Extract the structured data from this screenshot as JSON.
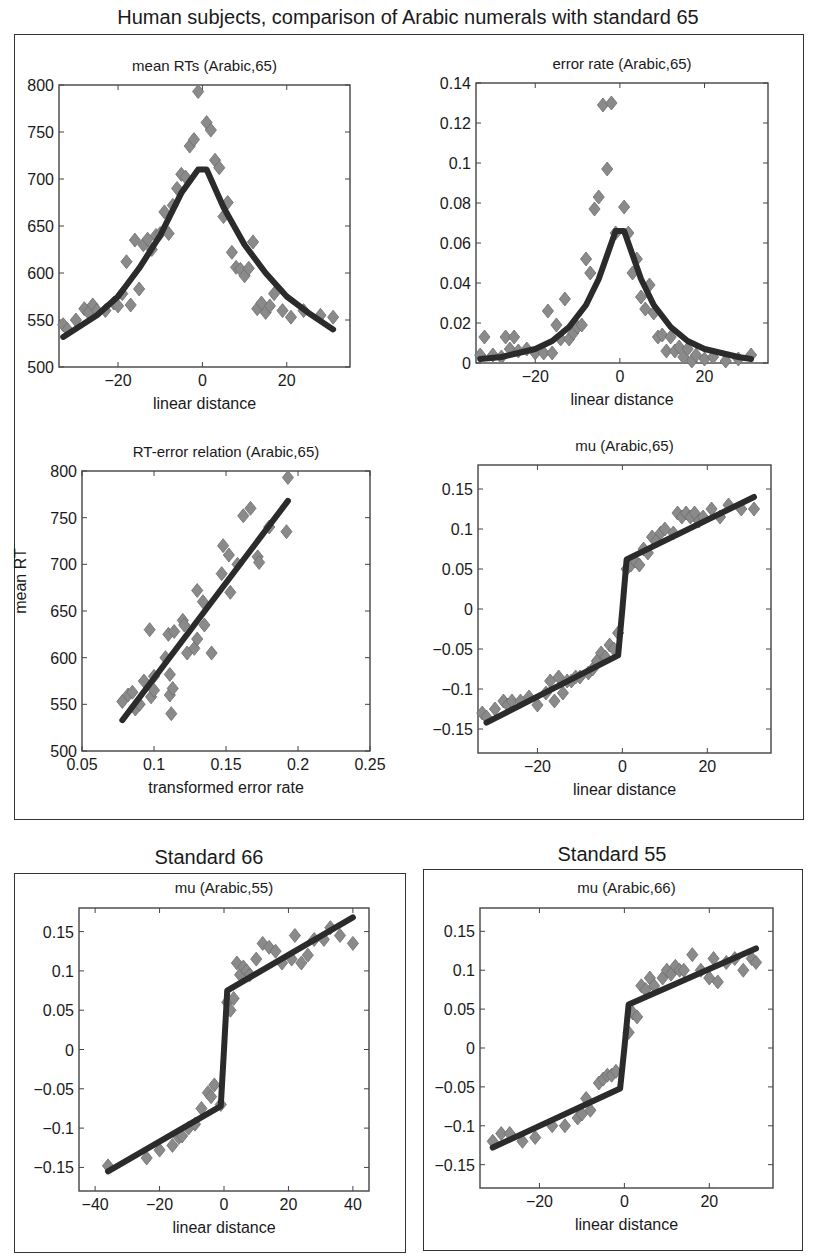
{
  "figure": {
    "title": "Human subjects, comparison of Arabic numerals with standard 65",
    "group_titles": [
      "Standard 66",
      "Standard 55"
    ],
    "colors": {
      "marker": "#8a8a8a",
      "marker_edge": "#6e6e6e",
      "fit_line": "#2b2b2b",
      "axes": "#444444"
    }
  },
  "chart_data": [
    {
      "id": "mean_rts",
      "type": "scatter",
      "title": "mean RTs (Arabic,65)",
      "xlabel": "linear distance",
      "ylabel": "",
      "xlim": [
        -34,
        35
      ],
      "ylim": [
        500,
        800
      ],
      "xticks": [
        -20,
        0,
        20
      ],
      "yticks": [
        500,
        550,
        600,
        650,
        700,
        750,
        800
      ],
      "xticklabels": [
        "−20",
        "0",
        "20"
      ],
      "yticklabels": [
        "500",
        "550",
        "600",
        "650",
        "700",
        "750",
        "800"
      ],
      "series": [
        {
          "name": "data",
          "kind": "scatter",
          "x": [
            -33,
            -32,
            -30,
            -28,
            -27,
            -26,
            -25,
            -23,
            -21,
            -20,
            -19,
            -18,
            -17,
            -16,
            -15,
            -14,
            -13,
            -12,
            -11,
            -10,
            -9,
            -8,
            -7,
            -6,
            -5,
            -4,
            -3,
            -2,
            -1,
            1,
            2,
            3,
            4,
            5,
            6,
            7,
            8,
            9,
            10,
            11,
            12,
            13,
            14,
            15,
            16,
            17,
            19,
            21,
            24,
            28,
            31
          ],
          "y": [
            545,
            540,
            550,
            562,
            558,
            566,
            560,
            560,
            568,
            565,
            578,
            612,
            566,
            635,
            583,
            630,
            636,
            625,
            640,
            642,
            665,
            642,
            672,
            690,
            705,
            702,
            735,
            742,
            793,
            760,
            752,
            720,
            712,
            660,
            675,
            622,
            606,
            604,
            597,
            605,
            633,
            562,
            568,
            558,
            565,
            578,
            560,
            553,
            560,
            555,
            553
          ]
        },
        {
          "name": "fit",
          "kind": "line",
          "x": [
            -33,
            -25,
            -20,
            -15,
            -10,
            -5,
            -1,
            1,
            5,
            10,
            15,
            20,
            25,
            31
          ],
          "y": [
            532,
            555,
            575,
            605,
            640,
            685,
            710,
            710,
            670,
            630,
            600,
            575,
            558,
            540
          ]
        }
      ]
    },
    {
      "id": "error_rate",
      "type": "scatter",
      "title": "error rate (Arabic,65)",
      "xlabel": "linear distance",
      "ylabel": "",
      "xlim": [
        -34,
        35
      ],
      "ylim": [
        0,
        0.14
      ],
      "xticks": [
        -20,
        0,
        20
      ],
      "yticks": [
        0,
        0.02,
        0.04,
        0.06,
        0.08,
        0.1,
        0.12,
        0.14
      ],
      "xticklabels": [
        "−20",
        "0",
        "20"
      ],
      "yticklabels": [
        "0",
        "0.02",
        "0.04",
        "0.06",
        "0.08",
        "0.1",
        "0.12",
        "0.14"
      ],
      "series": [
        {
          "name": "data",
          "kind": "scatter",
          "x": [
            -33,
            -32,
            -30,
            -28,
            -27,
            -26,
            -25,
            -24,
            -22,
            -20,
            -18,
            -17,
            -16,
            -15,
            -14,
            -13,
            -12,
            -11,
            -10,
            -9,
            -8,
            -7,
            -6,
            -5,
            -4,
            -3,
            -2,
            -1,
            1,
            2,
            3,
            4,
            5,
            6,
            7,
            8,
            9,
            10,
            11,
            12,
            13,
            14,
            15,
            16,
            17,
            18,
            20,
            22,
            25,
            28,
            31
          ],
          "y": [
            0.004,
            0.013,
            0.004,
            0.003,
            0.013,
            0.007,
            0.013,
            0.006,
            0.007,
            0.005,
            0.005,
            0.026,
            0.005,
            0.019,
            0.012,
            0.032,
            0.012,
            0.015,
            0.018,
            0.019,
            0.052,
            0.045,
            0.077,
            0.083,
            0.129,
            0.097,
            0.13,
            0.065,
            0.078,
            0.065,
            0.045,
            0.052,
            0.033,
            0.027,
            0.039,
            0.025,
            0.013,
            0.014,
            0.006,
            0.013,
            0.006,
            0.008,
            0.003,
            0.007,
            0.001,
            0.004,
            0.002,
            0.003,
            0.001,
            0.002,
            0.004
          ]
        },
        {
          "name": "fit",
          "kind": "line",
          "x": [
            -33,
            -28,
            -24,
            -20,
            -16,
            -12,
            -8,
            -5,
            -3,
            -1,
            1,
            3,
            5,
            8,
            12,
            16,
            20,
            24,
            28,
            31
          ],
          "y": [
            0.002,
            0.003,
            0.005,
            0.007,
            0.011,
            0.018,
            0.029,
            0.042,
            0.054,
            0.066,
            0.066,
            0.054,
            0.042,
            0.029,
            0.018,
            0.011,
            0.007,
            0.005,
            0.003,
            0.002
          ]
        }
      ]
    },
    {
      "id": "rt_error_relation",
      "type": "scatter",
      "title": "RT-error relation (Arabic,65)",
      "xlabel": "transformed error rate",
      "ylabel": "mean RT",
      "xlim": [
        0.05,
        0.25
      ],
      "ylim": [
        500,
        800
      ],
      "xticks": [
        0.05,
        0.1,
        0.15,
        0.2,
        0.25
      ],
      "yticks": [
        500,
        550,
        600,
        650,
        700,
        750,
        800
      ],
      "xticklabels": [
        "0.05",
        "0.1",
        "0.15",
        "0.2",
        "0.25"
      ],
      "yticklabels": [
        "500",
        "550",
        "600",
        "650",
        "700",
        "750",
        "800"
      ],
      "series": [
        {
          "name": "data",
          "kind": "scatter",
          "x": [
            0.078,
            0.082,
            0.085,
            0.087,
            0.09,
            0.093,
            0.097,
            0.098,
            0.1,
            0.1,
            0.108,
            0.11,
            0.111,
            0.111,
            0.112,
            0.113,
            0.114,
            0.12,
            0.121,
            0.123,
            0.128,
            0.13,
            0.13,
            0.134,
            0.135,
            0.14,
            0.147,
            0.148,
            0.152,
            0.153,
            0.158,
            0.162,
            0.167,
            0.172,
            0.173,
            0.18,
            0.192,
            0.193
          ],
          "y": [
            553,
            560,
            563,
            545,
            550,
            575,
            630,
            558,
            580,
            565,
            600,
            625,
            582,
            560,
            540,
            567,
            628,
            640,
            635,
            605,
            610,
            620,
            672,
            660,
            635,
            605,
            690,
            720,
            710,
            670,
            700,
            752,
            760,
            708,
            702,
            740,
            735,
            793
          ]
        },
        {
          "name": "fit",
          "kind": "line",
          "x": [
            0.078,
            0.193
          ],
          "y": [
            533,
            768
          ]
        }
      ]
    },
    {
      "id": "mu_65",
      "type": "scatter",
      "title": "mu (Arabic,65)",
      "xlabel": "linear distance",
      "ylabel": "",
      "xlim": [
        -34,
        35
      ],
      "ylim": [
        -0.18,
        0.18
      ],
      "xticks": [
        -20,
        0,
        20
      ],
      "yticks": [
        -0.15,
        -0.1,
        -0.05,
        0,
        0.05,
        0.1,
        0.15
      ],
      "xticklabels": [
        "−20",
        "0",
        "20"
      ],
      "yticklabels": [
        "−0.15",
        "−0.1",
        "−0.05",
        "0",
        "0.05",
        "0.1",
        "0.15"
      ],
      "series": [
        {
          "name": "data",
          "kind": "scatter",
          "x": [
            -33,
            -32,
            -30,
            -28,
            -27,
            -26,
            -24,
            -22,
            -20,
            -18,
            -17,
            -16,
            -15,
            -14,
            -13,
            -12,
            -11,
            -10,
            -8,
            -7,
            -6,
            -5,
            -4,
            -3,
            -2,
            -1,
            1,
            2,
            3,
            4,
            5,
            6,
            7,
            8,
            9,
            10,
            12,
            13,
            14,
            15,
            16,
            17,
            18,
            19,
            21,
            23,
            25,
            28,
            31
          ],
          "y": [
            -0.13,
            -0.135,
            -0.125,
            -0.115,
            -0.12,
            -0.115,
            -0.115,
            -0.11,
            -0.12,
            -0.105,
            -0.09,
            -0.115,
            -0.085,
            -0.105,
            -0.09,
            -0.09,
            -0.085,
            -0.085,
            -0.08,
            -0.075,
            -0.065,
            -0.055,
            -0.06,
            -0.045,
            -0.05,
            -0.03,
            0.05,
            0.055,
            0.06,
            0.055,
            0.075,
            0.07,
            0.09,
            0.085,
            0.095,
            0.1,
            0.095,
            0.12,
            0.115,
            0.12,
            0.115,
            0.12,
            0.11,
            0.115,
            0.125,
            0.115,
            0.13,
            0.125,
            0.125
          ]
        },
        {
          "name": "fit",
          "kind": "line",
          "x": [
            -32,
            -1,
            0,
            1,
            31
          ],
          "y": [
            -0.142,
            -0.058,
            0.0,
            0.062,
            0.14
          ]
        }
      ]
    },
    {
      "id": "mu_55",
      "group": "Standard 66",
      "type": "scatter",
      "title": "mu (Arabic,55)",
      "xlabel": "linear distance",
      "ylabel": "",
      "xlim": [
        -45,
        45
      ],
      "ylim": [
        -0.18,
        0.18
      ],
      "xticks": [
        -40,
        -20,
        0,
        20,
        40
      ],
      "yticks": [
        -0.15,
        -0.1,
        -0.05,
        0,
        0.05,
        0.1,
        0.15
      ],
      "xticklabels": [
        "−40",
        "−20",
        "0",
        "20",
        "40"
      ],
      "yticklabels": [
        "−0.15",
        "−0.1",
        "−0.05",
        "0",
        "0.05",
        "0.1",
        "0.15"
      ],
      "series": [
        {
          "name": "data",
          "kind": "scatter",
          "x": [
            -36,
            -24,
            -20,
            -16,
            -14,
            -13,
            -11,
            -9,
            -7,
            -5,
            -4,
            -3,
            -1,
            1,
            2,
            3,
            4,
            5,
            6,
            7,
            8,
            10,
            12,
            14,
            16,
            18,
            21,
            22,
            24,
            26,
            28,
            31,
            33,
            36,
            40
          ],
          "y": [
            -0.148,
            -0.138,
            -0.128,
            -0.122,
            -0.112,
            -0.11,
            -0.1,
            -0.095,
            -0.075,
            -0.055,
            -0.06,
            -0.045,
            -0.07,
            0.06,
            0.05,
            0.065,
            0.11,
            0.095,
            0.105,
            0.1,
            0.095,
            0.115,
            0.135,
            0.13,
            0.125,
            0.11,
            0.115,
            0.145,
            0.11,
            0.12,
            0.14,
            0.14,
            0.155,
            0.145,
            0.135
          ]
        },
        {
          "name": "fit",
          "kind": "line",
          "x": [
            -36,
            -1,
            0,
            1,
            40
          ],
          "y": [
            -0.155,
            -0.072,
            0.0,
            0.075,
            0.168
          ]
        }
      ]
    },
    {
      "id": "mu_66",
      "group": "Standard 55",
      "type": "scatter",
      "title": "mu (Arabic,66)",
      "xlabel": "linear distance",
      "ylabel": "",
      "xlim": [
        -34,
        35
      ],
      "ylim": [
        -0.18,
        0.18
      ],
      "xticks": [
        -20,
        0,
        20
      ],
      "yticks": [
        -0.15,
        -0.1,
        -0.05,
        0,
        0.05,
        0.1,
        0.15
      ],
      "xticklabels": [
        "−20",
        "0",
        "20"
      ],
      "yticklabels": [
        "−0.15",
        "−0.1",
        "−0.05",
        "0",
        "0.05",
        "0.1",
        "0.15"
      ],
      "series": [
        {
          "name": "data",
          "kind": "scatter",
          "x": [
            -31,
            -29,
            -27,
            -24,
            -21,
            -17,
            -14,
            -11,
            -10,
            -9,
            -8,
            -6,
            -5,
            -4,
            -3,
            -2,
            1,
            2,
            3,
            4,
            5,
            6,
            7,
            9,
            10,
            11,
            12,
            13,
            14,
            16,
            18,
            20,
            21,
            22,
            24,
            26,
            28,
            30,
            31
          ],
          "y": [
            -0.12,
            -0.11,
            -0.11,
            -0.12,
            -0.115,
            -0.1,
            -0.1,
            -0.09,
            -0.085,
            -0.065,
            -0.08,
            -0.045,
            -0.04,
            -0.035,
            -0.035,
            -0.03,
            0.02,
            0.045,
            0.04,
            0.08,
            0.075,
            0.09,
            0.08,
            0.09,
            0.1,
            0.095,
            0.105,
            0.1,
            0.1,
            0.12,
            0.1,
            0.09,
            0.115,
            0.085,
            0.11,
            0.115,
            0.1,
            0.115,
            0.11
          ]
        },
        {
          "name": "fit",
          "kind": "line",
          "x": [
            -31,
            -1,
            0,
            1,
            31
          ],
          "y": [
            -0.128,
            -0.052,
            0.0,
            0.056,
            0.128
          ]
        }
      ]
    }
  ]
}
